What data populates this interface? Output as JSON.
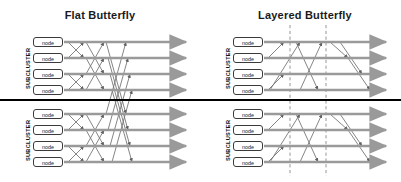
{
  "diagram": {
    "background_color": "#ffffff",
    "divider": {
      "color": "#000000",
      "y": 99,
      "thickness": 2
    },
    "colors": {
      "arrow_gray": "#9a9a9a",
      "link_gray": "#6f6f6f",
      "node_border": "#3a3a3a",
      "node_fill": "#ffffff",
      "text": "#1a1a1a",
      "dashed_line": "#8a8a8a"
    }
  },
  "panels": [
    {
      "id": "flat",
      "title": "Flat Butterfly",
      "title_x": 100,
      "origin_x": 0,
      "subclusters": [
        {
          "label": "SUBCLUSTER",
          "label_x": 25,
          "label_y": 40,
          "label_height": 56,
          "nodes": [
            {
              "label": "node",
              "x": 33,
              "y": 37
            },
            {
              "label": "node",
              "x": 33,
              "y": 53
            },
            {
              "label": "node",
              "x": 33,
              "y": 69
            },
            {
              "label": "node",
              "x": 33,
              "y": 85
            }
          ],
          "rows_y": [
            42,
            58,
            74,
            90
          ]
        },
        {
          "label": "SUBCLUSTER",
          "label_x": 25,
          "label_y": 112,
          "label_height": 56,
          "nodes": [
            {
              "label": "node",
              "x": 33,
              "y": 109
            },
            {
              "label": "node",
              "x": 33,
              "y": 125
            },
            {
              "label": "node",
              "x": 33,
              "y": 141
            },
            {
              "label": "node",
              "x": 33,
              "y": 157
            }
          ],
          "rows_y": [
            114,
            130,
            146,
            162
          ]
        }
      ],
      "arrows": {
        "start_x": 64,
        "end_x": 186,
        "rows_y": [
          42,
          58,
          74,
          90,
          114,
          130,
          146,
          162
        ]
      },
      "dashed_lines": []
    },
    {
      "id": "layered",
      "title": "Layered Butterfly",
      "title_x": 305,
      "origin_x": 200,
      "subclusters": [
        {
          "label": "SUBCLUSTER",
          "label_x": 225,
          "label_y": 40,
          "label_height": 56,
          "nodes": [
            {
              "label": "node",
              "x": 233,
              "y": 37
            },
            {
              "label": "node",
              "x": 233,
              "y": 53
            },
            {
              "label": "node",
              "x": 233,
              "y": 69
            },
            {
              "label": "node",
              "x": 233,
              "y": 85
            }
          ],
          "rows_y": [
            42,
            58,
            74,
            90
          ]
        },
        {
          "label": "SUBCLUSTER",
          "label_x": 225,
          "label_y": 112,
          "label_height": 56,
          "nodes": [
            {
              "label": "node",
              "x": 233,
              "y": 109
            },
            {
              "label": "node",
              "x": 233,
              "y": 125
            },
            {
              "label": "node",
              "x": 233,
              "y": 141
            },
            {
              "label": "node",
              "x": 233,
              "y": 157
            }
          ],
          "rows_y": [
            114,
            130,
            146,
            162
          ]
        }
      ],
      "arrows": {
        "start_x": 264,
        "end_x": 386,
        "rows_y": [
          42,
          58,
          74,
          90,
          114,
          130,
          146,
          162
        ]
      },
      "dashed_lines": [
        {
          "x": 290,
          "y1": 25,
          "y2": 176
        },
        {
          "x": 326,
          "y1": 25,
          "y2": 176
        }
      ]
    }
  ],
  "links": {
    "flat": [
      {
        "x1": 68,
        "y1": 42,
        "x2": 84,
        "y2": 58
      },
      {
        "x1": 68,
        "y1": 58,
        "x2": 84,
        "y2": 42
      },
      {
        "x1": 68,
        "y1": 74,
        "x2": 84,
        "y2": 90
      },
      {
        "x1": 68,
        "y1": 90,
        "x2": 84,
        "y2": 74
      },
      {
        "x1": 86,
        "y1": 42,
        "x2": 104,
        "y2": 74
      },
      {
        "x1": 86,
        "y1": 74,
        "x2": 104,
        "y2": 42
      },
      {
        "x1": 86,
        "y1": 58,
        "x2": 104,
        "y2": 90
      },
      {
        "x1": 86,
        "y1": 90,
        "x2": 104,
        "y2": 58
      },
      {
        "x1": 68,
        "y1": 114,
        "x2": 84,
        "y2": 130
      },
      {
        "x1": 68,
        "y1": 130,
        "x2": 84,
        "y2": 114
      },
      {
        "x1": 68,
        "y1": 146,
        "x2": 84,
        "y2": 162
      },
      {
        "x1": 68,
        "y1": 162,
        "x2": 84,
        "y2": 146
      },
      {
        "x1": 86,
        "y1": 114,
        "x2": 104,
        "y2": 146
      },
      {
        "x1": 86,
        "y1": 146,
        "x2": 104,
        "y2": 114
      },
      {
        "x1": 86,
        "y1": 130,
        "x2": 104,
        "y2": 162
      },
      {
        "x1": 86,
        "y1": 162,
        "x2": 104,
        "y2": 130
      },
      {
        "x1": 106,
        "y1": 42,
        "x2": 126,
        "y2": 114
      },
      {
        "x1": 106,
        "y1": 114,
        "x2": 126,
        "y2": 42
      },
      {
        "x1": 108,
        "y1": 58,
        "x2": 128,
        "y2": 130
      },
      {
        "x1": 108,
        "y1": 130,
        "x2": 128,
        "y2": 58
      },
      {
        "x1": 110,
        "y1": 74,
        "x2": 130,
        "y2": 146
      },
      {
        "x1": 110,
        "y1": 146,
        "x2": 130,
        "y2": 74
      },
      {
        "x1": 112,
        "y1": 90,
        "x2": 132,
        "y2": 162
      },
      {
        "x1": 112,
        "y1": 162,
        "x2": 132,
        "y2": 90
      }
    ],
    "layered": [
      {
        "x1": 268,
        "y1": 58,
        "x2": 284,
        "y2": 42
      },
      {
        "x1": 268,
        "y1": 90,
        "x2": 284,
        "y2": 74
      },
      {
        "x1": 268,
        "y1": 130,
        "x2": 284,
        "y2": 114
      },
      {
        "x1": 268,
        "y1": 162,
        "x2": 284,
        "y2": 146
      },
      {
        "x1": 270,
        "y1": 90,
        "x2": 300,
        "y2": 42
      },
      {
        "x1": 270,
        "y1": 162,
        "x2": 300,
        "y2": 114
      },
      {
        "x1": 296,
        "y1": 42,
        "x2": 318,
        "y2": 90
      },
      {
        "x1": 296,
        "y1": 114,
        "x2": 318,
        "y2": 162
      },
      {
        "x1": 300,
        "y1": 90,
        "x2": 322,
        "y2": 42
      },
      {
        "x1": 300,
        "y1": 162,
        "x2": 322,
        "y2": 114
      },
      {
        "x1": 330,
        "y1": 42,
        "x2": 348,
        "y2": 58
      },
      {
        "x1": 330,
        "y1": 114,
        "x2": 348,
        "y2": 130
      },
      {
        "x1": 340,
        "y1": 42,
        "x2": 362,
        "y2": 74
      },
      {
        "x1": 340,
        "y1": 114,
        "x2": 362,
        "y2": 146
      },
      {
        "x1": 348,
        "y1": 58,
        "x2": 370,
        "y2": 90
      },
      {
        "x1": 348,
        "y1": 130,
        "x2": 370,
        "y2": 162
      }
    ]
  }
}
